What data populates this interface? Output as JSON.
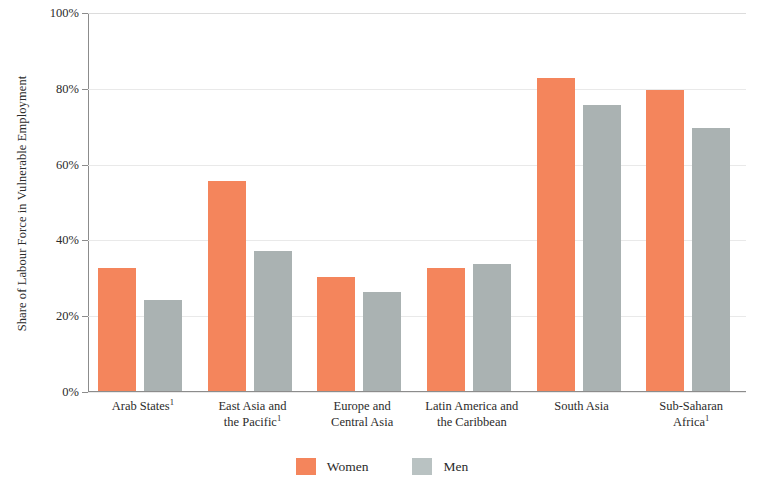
{
  "chart_data": {
    "type": "bar",
    "title": "",
    "subtitle": "",
    "xlabel": "",
    "ylabel": "Share of Labour Force in Vulnerable Employment",
    "ylim": [
      0,
      100
    ],
    "ytick_labels": [
      "0%",
      "20%",
      "40%",
      "60%",
      "80%",
      "100%"
    ],
    "ytick_values": [
      0,
      20,
      40,
      60,
      80,
      100
    ],
    "grid": true,
    "grid_axis": "y",
    "legend_position": "bottom",
    "categories": [
      "Arab States¹",
      "East Asia and the Pacific¹",
      "Europe and Central Asia",
      "Latin America and the Caribbean",
      "South Asia",
      "Sub-Saharan Africa¹"
    ],
    "categories_lines": [
      [
        "Arab States",
        "1"
      ],
      [
        "East Asia and",
        "the Pacific",
        "1"
      ],
      [
        "Europe and",
        "Central Asia",
        ""
      ],
      [
        "Latin America and",
        "the Caribbean",
        ""
      ],
      [
        "South Asia",
        "",
        ""
      ],
      [
        "Sub-Saharan",
        "Africa",
        "1"
      ]
    ],
    "series": [
      {
        "name": "Women",
        "color": "#f4855c",
        "values": [
          32.5,
          55.5,
          30.0,
          32.5,
          82.5,
          79.5
        ]
      },
      {
        "name": "Men",
        "color": "#aab2b2",
        "values": [
          24.0,
          37.0,
          26.0,
          33.5,
          75.5,
          69.5
        ]
      }
    ]
  },
  "legend": {
    "items": [
      {
        "label": "Women",
        "color": "#f4855c"
      },
      {
        "label": "Men",
        "color": "#b9c2c2"
      }
    ]
  },
  "axis": {
    "y_title": "Share of Labour Force in Vulnerable Employment"
  }
}
